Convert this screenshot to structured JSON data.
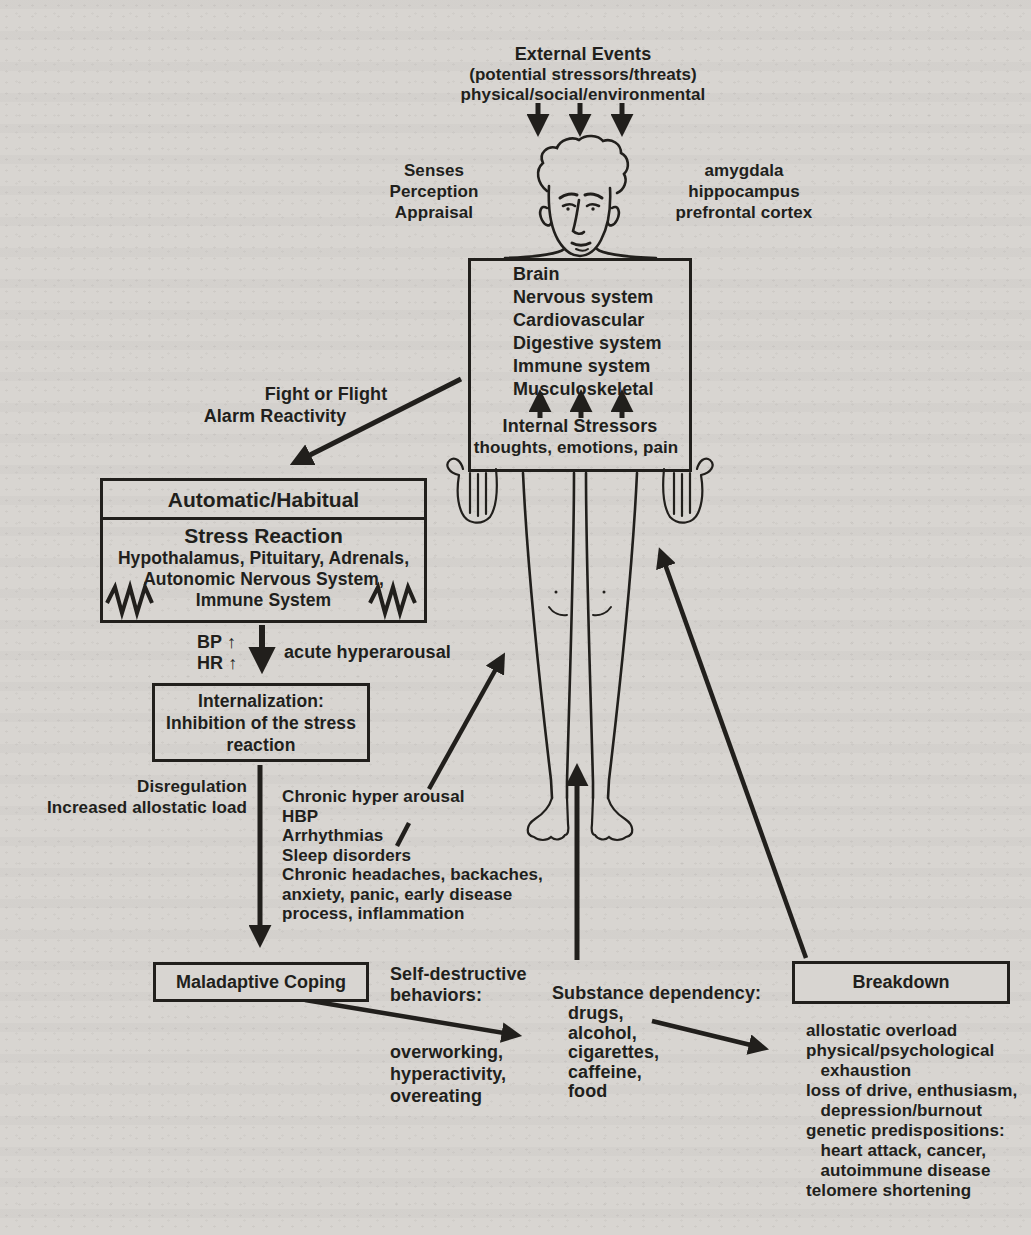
{
  "colors": {
    "ink": "#211f1c",
    "paper": "#d8d5d1"
  },
  "external_events": {
    "title": "External Events",
    "subtitle": "(potential stressors/threats)",
    "subtitle2": "physical/social/environmental"
  },
  "appraisal": "Senses\nPerception\nAppraisal",
  "brain_regions": "amygdala\nhippocampus\nprefrontal cortex",
  "body_box": {
    "systems": "Brain\nNervous system\nCardiovascular\nDigestive system\nImmune system\nMusculoskeletal",
    "internal_title": "Internal Stressors",
    "internal_subtitle": "thoughts, emotions, pain"
  },
  "fight_flight": {
    "line1": "Fight or Flight",
    "line2": "Alarm Reactivity"
  },
  "stress_box": {
    "header": "Automatic/Habitual",
    "title": "Stress Reaction",
    "body": "Hypothalamus, Pituitary, Adrenals,\nAutonomic Nervous System,\nImmune System"
  },
  "acute": {
    "vitals": "BP ↑\nHR ↑",
    "label": "acute hyperarousal"
  },
  "internalization": "Internalization:\nInhibition of the stress\nreaction",
  "disregulation": "Disregulation\nIncreased allostatic load",
  "chronic_effects": "Chronic hyper arousal\nHBP\nArrhythmias\nSleep disorders\nChronic headaches, backaches,\nanxiety, panic, early disease\nprocess, inflammation",
  "maladaptive": "Maladaptive Coping",
  "self_destructive": "Self-destructive\nbehaviors:",
  "behaviors": "overworking,\nhyperactivity,\novereating",
  "substance": {
    "title": "Substance dependency:",
    "items": "drugs,\nalcohol,\ncigarettes,\ncaffeine,\nfood"
  },
  "breakdown": {
    "title": "Breakdown",
    "effects": "allostatic overload\nphysical/psychological\n   exhaustion\nloss of drive, enthusiasm,\n   depression/burnout\ngenetic predispositions:\n   heart attack, cancer,\n   autoimmune disease\ntelomere shortening"
  }
}
